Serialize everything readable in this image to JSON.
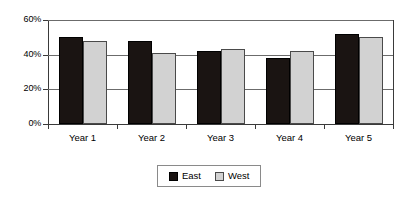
{
  "chart_data": {
    "type": "bar",
    "title": "",
    "subtitle": "",
    "xlabel": "",
    "ylabel": "",
    "categories": [
      "Year 1",
      "Year 2",
      "Year 3",
      "Year 4",
      "Year 5"
    ],
    "series": [
      {
        "name": "East",
        "color": "#1a1412",
        "values": [
          50,
          48,
          42,
          38,
          52
        ]
      },
      {
        "name": "West",
        "color": "#d2d2d2",
        "values": [
          48,
          41,
          43,
          42,
          50
        ]
      }
    ],
    "ylim": [
      0,
      60
    ],
    "ytick_values": [
      0,
      20,
      40,
      60
    ],
    "ytick_labels": [
      "0%",
      "20%",
      "40%",
      "60%"
    ],
    "grid": true,
    "grid_axis": "y",
    "legend_position": "bottom",
    "annotations": []
  },
  "legend": {
    "entries": [
      {
        "label": "East",
        "swatch": "east"
      },
      {
        "label": "West",
        "swatch": "west"
      }
    ]
  }
}
